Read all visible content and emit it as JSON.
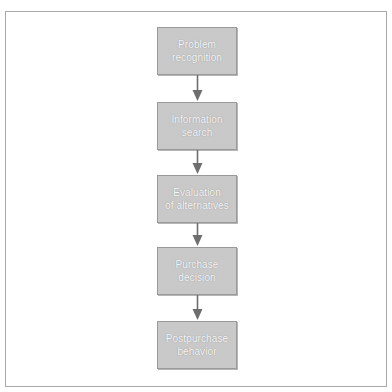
{
  "diagram": {
    "type": "flowchart",
    "direction": "top-to-bottom",
    "steps": [
      {
        "label": "Problem\nrecognition"
      },
      {
        "label": "Information\nsearch"
      },
      {
        "label": "Evaluation\nof alternatives"
      },
      {
        "label": "Purchase\ndecision"
      },
      {
        "label": "Postpurchase\nbehavior"
      }
    ],
    "colors": {
      "box_fill": "#d3d3d3",
      "box_border": "#9a9a9a",
      "label_text": "#f6f6f6",
      "arrow": "#6e6e6e",
      "frame_border": "#a9a9a9"
    }
  }
}
